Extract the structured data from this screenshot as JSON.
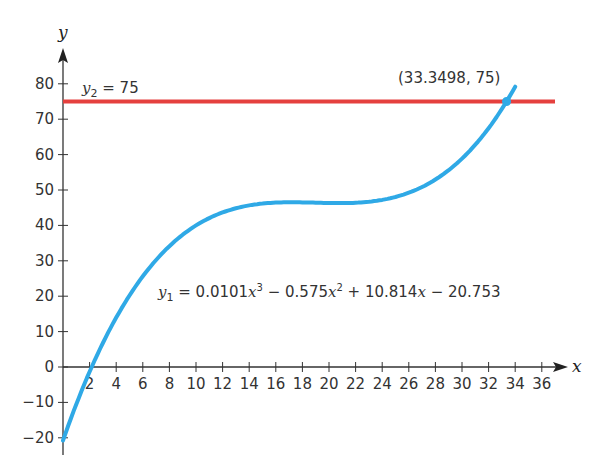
{
  "chart_data": {
    "type": "line",
    "title": "",
    "xlabel": "x",
    "ylabel": "y",
    "xlim": [
      0,
      37.5
    ],
    "ylim": [
      -25,
      85
    ],
    "grid": false,
    "x_ticks": [
      2,
      4,
      6,
      8,
      10,
      12,
      14,
      16,
      18,
      20,
      22,
      24,
      26,
      28,
      30,
      32,
      34,
      36
    ],
    "y_ticks": [
      -20,
      -10,
      0,
      10,
      20,
      30,
      40,
      50,
      60,
      70,
      80
    ],
    "series": [
      {
        "name": "y1",
        "label": "y₁ = 0.0101x³ − 0.575x² + 10.814x − 20.753",
        "coefficients": [
          0.0101,
          -0.575,
          10.814,
          -20.753
        ],
        "x_range": [
          0,
          34
        ],
        "color": "#2fa9e6"
      },
      {
        "name": "y2",
        "label": "y₂ = 75",
        "constant": 75,
        "x_range": [
          0,
          38.5
        ],
        "color": "#e5403e"
      }
    ],
    "annotations": [
      {
        "text": "(33.3498, 75)",
        "x": 33.3498,
        "y": 75,
        "marker": "point"
      }
    ]
  },
  "labels": {
    "x_axis": "x",
    "y_axis": "y",
    "y2_prefix": "y",
    "y2_sub": "2",
    "y2_rest": " = 75",
    "y1_prefix": "y",
    "y1_sub": "1",
    "y1_p1": " = 0.0101",
    "y1_x1": "x",
    "y1_e1": "3",
    "y1_p2": " − 0.575",
    "y1_x2": "x",
    "y1_e2": "2",
    "y1_p3": " + 10.814",
    "y1_x3": "x",
    "y1_p4": " − 20.753",
    "intersection": "(33.3498, 75)"
  }
}
